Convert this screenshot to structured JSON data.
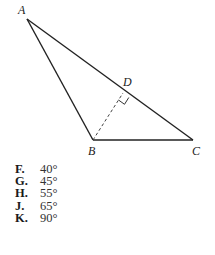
{
  "figure": {
    "vertices": {
      "A": {
        "label": "A"
      },
      "B": {
        "label": "B"
      },
      "C": {
        "label": "C"
      },
      "D": {
        "label": "D"
      }
    },
    "segments": [
      {
        "from": "A",
        "to": "B",
        "style": "solid"
      },
      {
        "from": "B",
        "to": "C",
        "style": "solid"
      },
      {
        "from": "A",
        "to": "C",
        "style": "solid"
      },
      {
        "from": "B",
        "to": "D",
        "style": "dashed"
      }
    ],
    "right_angle_at": "D"
  },
  "choices": [
    {
      "letter": "F.",
      "value": "40°"
    },
    {
      "letter": "G.",
      "value": "45°"
    },
    {
      "letter": "H.",
      "value": "55°"
    },
    {
      "letter": "J.",
      "value": "65°"
    },
    {
      "letter": "K.",
      "value": "90°"
    }
  ]
}
